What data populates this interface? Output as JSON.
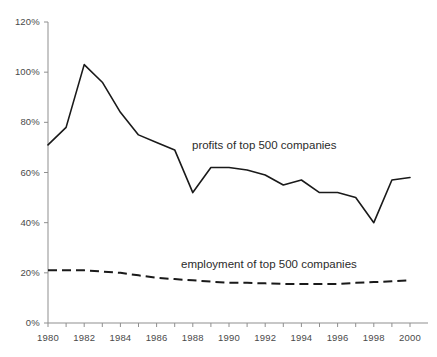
{
  "chart_data": {
    "type": "line",
    "title": "",
    "xlabel": "",
    "ylabel": "",
    "xlim": [
      1980,
      2000
    ],
    "ylim": [
      0,
      120
    ],
    "grid": false,
    "legend_position": "inline-annotations",
    "y_tick_labels": [
      "0%",
      "20%",
      "40%",
      "60%",
      "80%",
      "100%",
      "120%"
    ],
    "y_ticks": [
      0,
      20,
      40,
      60,
      80,
      100,
      120
    ],
    "x_tick_labels": [
      "1980",
      "1982",
      "1984",
      "1986",
      "1988",
      "1990",
      "1992",
      "1994",
      "1996",
      "1998",
      "2000"
    ],
    "x_ticks": [
      1980,
      1982,
      1984,
      1986,
      1988,
      1990,
      1992,
      1994,
      1996,
      1998,
      2000
    ],
    "x_minor_ticks": [
      1981,
      1983,
      1985,
      1987,
      1989,
      1991,
      1993,
      1995,
      1997,
      1999
    ],
    "x": [
      1980,
      1981,
      1982,
      1983,
      1984,
      1985,
      1986,
      1987,
      1988,
      1989,
      1990,
      1991,
      1992,
      1993,
      1994,
      1995,
      1996,
      1997,
      1998,
      1999,
      2000
    ],
    "series": [
      {
        "name": "profits of top 500 companies",
        "style": "solid",
        "color": "#1a1a1a",
        "annotation": "profits of top 500 companies",
        "values": [
          71,
          78,
          103,
          96,
          84,
          75,
          72,
          69,
          52,
          62,
          62,
          61,
          59,
          55,
          57,
          52,
          52,
          50,
          40,
          57,
          58
        ]
      },
      {
        "name": "employment of top 500 companies",
        "style": "dashed",
        "color": "#1a1a1a",
        "annotation": "employment of top 500 companies",
        "values": [
          21,
          21,
          21,
          20.5,
          20,
          19,
          18,
          17.5,
          17,
          16.5,
          16,
          16,
          15.8,
          15.6,
          15.5,
          15.5,
          15.6,
          16,
          16.3,
          16.6,
          17
        ]
      }
    ]
  },
  "annotations": {
    "profits_label": "profits of top 500 companies",
    "employment_label": "employment of top 500 companies"
  },
  "axis": {
    "line_color": "#8f8f8f",
    "tick_color": "#8f8f8f",
    "label_color": "#4a4a4a"
  }
}
